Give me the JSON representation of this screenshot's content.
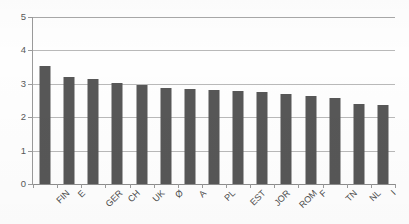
{
  "chart_data": {
    "type": "bar",
    "title": "",
    "subtitle": "",
    "xlabel": "",
    "ylabel": "",
    "categories": [
      "FIN",
      "E",
      "GER",
      "CH",
      "UK",
      "Ø",
      "A",
      "PL",
      "EST",
      "JOR",
      "ROM",
      "F",
      "TN",
      "NL",
      "I"
    ],
    "values": [
      3.52,
      3.19,
      3.13,
      3.02,
      2.97,
      2.86,
      2.84,
      2.8,
      2.77,
      2.74,
      2.7,
      2.65,
      2.59,
      2.41,
      2.38
    ],
    "ylim": [
      0,
      5
    ],
    "y_ticks": [
      0,
      1,
      2,
      3,
      4,
      5
    ],
    "y_tick_labels": [
      "0",
      "1",
      "2",
      "3",
      "4",
      "5"
    ],
    "grid": true,
    "grid_axis": "y",
    "legend": false,
    "legend_position": "none",
    "series": [
      {
        "name": "",
        "values": [
          3.52,
          3.19,
          3.13,
          3.02,
          2.97,
          2.86,
          2.84,
          2.8,
          2.77,
          2.74,
          2.7,
          2.65,
          2.59,
          2.41,
          2.38
        ]
      }
    ],
    "annotations": []
  },
  "style": {
    "bar_color": "#575757",
    "grid_color": "#b9b9b9",
    "axis_color": "#9a9a9a",
    "label_color": "#4a4a4a",
    "tick_label_color": "#585858",
    "background": "#ffffff"
  }
}
